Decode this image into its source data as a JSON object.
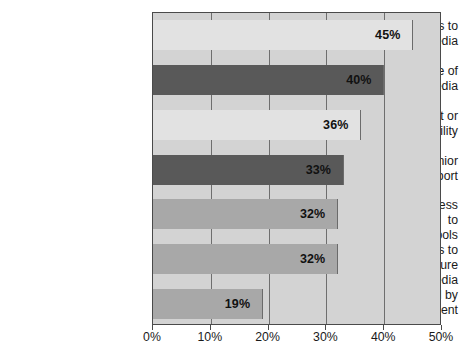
{
  "chart_data": {
    "type": "bar",
    "orientation": "horizontal",
    "title": "",
    "subtitle": "",
    "xlabel": "",
    "ylabel": "",
    "xlim": [
      0,
      50
    ],
    "grid": true,
    "legend": "none",
    "xticks": [
      "0%",
      "10%",
      "20%",
      "30%",
      "40%",
      "50%"
    ],
    "xtick_values": [
      0,
      10,
      20,
      30,
      40,
      50
    ],
    "categories": [
      "Limited staff/resources to implement social media",
      "Limited knowledge of social media",
      "Lack of IT support or technical capability",
      "Lack of CEO or senior management support",
      "Lack of employee access to online social media tools",
      "Lack of metrics to measure impact of social media",
      "Restrictions imposed by legal department"
    ],
    "values": [
      45,
      40,
      36,
      33,
      32,
      32,
      19
    ],
    "data_labels": [
      "45%",
      "40%",
      "36%",
      "33%",
      "32%",
      "32%",
      "19%"
    ],
    "bars": [
      {
        "label_line1": "Limited staff/resources to",
        "label_line2": "implement social media",
        "value": 45,
        "data_label": "45%",
        "color": "#e2e2e2"
      },
      {
        "label_line1": "Limited knowledge of",
        "label_line2": "social media",
        "value": 40,
        "data_label": "40%",
        "color": "#595959"
      },
      {
        "label_line1": "Lack of IT support or",
        "label_line2": "technical capability",
        "value": 36,
        "data_label": "36%",
        "color": "#e2e2e2"
      },
      {
        "label_line1": "Lack of CEO or senior",
        "label_line2": "management support",
        "value": 33,
        "data_label": "33%",
        "color": "#595959"
      },
      {
        "label_line1": "Lack of employee access to",
        "label_line2": "online social media tools",
        "value": 32,
        "data_label": "32%",
        "color": "#a8a8a8"
      },
      {
        "label_line1": "Lack of metrics to measure",
        "label_line2": "impact of social media",
        "value": 32,
        "data_label": "32%",
        "color": "#a8a8a8"
      },
      {
        "label_line1": "Restrictions imposed by",
        "label_line2": "legal department",
        "value": 19,
        "data_label": "19%",
        "color": "#a8a8a8"
      }
    ],
    "colors": {
      "plot_background": "#d3d3d3",
      "plot_border": "#4a4a4a",
      "gridline": "#6e6e6e",
      "label_text": "#1a1a1a",
      "value_text": "#111111",
      "page_background": "#ffffff"
    }
  }
}
